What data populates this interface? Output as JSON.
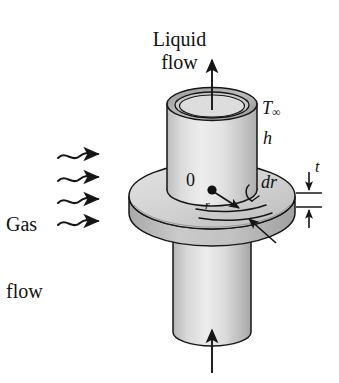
{
  "figure": {
    "title_top": "Liquid\nflow",
    "liquid_flow": {
      "line1": "Liquid",
      "line2": "flow"
    },
    "gas_flow": {
      "line1": "Gas",
      "line2": "flow"
    },
    "labels": {
      "t_infinity_symbol": "T",
      "t_infinity_subscript": "∞",
      "convection_coefficient": "h",
      "thickness": "t",
      "differential_radius": "dr",
      "origin": "0",
      "radius": "r"
    },
    "colors": {
      "background": "#ffffff",
      "outline": "#1a1a1a",
      "disk_top_face": "#d6d6d6",
      "disk_rim_band": "#b9b9b9",
      "pipe_body_light": "#e9e9e9",
      "pipe_body_mid": "#d2d2d2",
      "pipe_body_dark": "#b4b4b4",
      "pipe_rim_ring": "#a9a9a9",
      "pipe_bore_inner": "#cfcfcf"
    },
    "geometry": {
      "pipe_center_x": 212,
      "pipe_outer_half_width": 45,
      "disk_center_y": 196,
      "disk_half_width": 83,
      "disk_half_height": 33,
      "disk_thickness": 17,
      "wavy_arrow_rows_y": [
        155,
        178,
        200,
        222
      ],
      "wavy_arrow_count": 4
    }
  }
}
